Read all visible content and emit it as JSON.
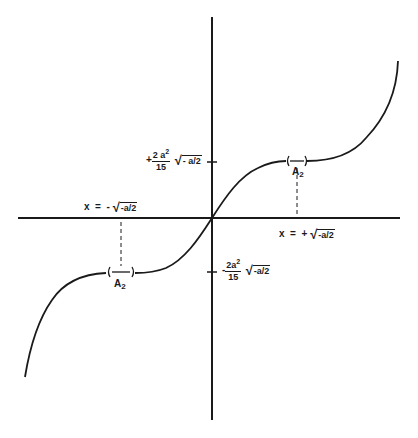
{
  "diagram": {
    "type": "function-graph",
    "colors": {
      "line": "#1a1a1a",
      "background": "#ffffff"
    },
    "axes": {
      "origin_px": [
        212,
        218
      ],
      "x_axis_px": [
        18,
        400
      ],
      "y_axis_px": [
        17,
        420
      ]
    },
    "labels": {
      "upper_tick": {
        "sign": "+",
        "numerator": "2 a",
        "exponent": "2",
        "denominator": "15",
        "radicand": "- a/2"
      },
      "lower_tick": {
        "sign": "-",
        "numerator": "2a",
        "exponent": "2",
        "denominator": "15",
        "radicand": "-a/2"
      },
      "x_left": {
        "prefix": "x  =  -",
        "radicand": "-a/2"
      },
      "x_right": {
        "prefix": "x  =  +",
        "radicand": "-a/2"
      },
      "a2_upper": {
        "base": "A",
        "sub": "2"
      },
      "a2_lower": {
        "base": "A",
        "sub": "2"
      }
    }
  }
}
